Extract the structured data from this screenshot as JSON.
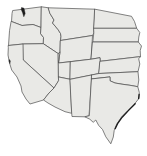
{
  "map": {
    "region": "Western United States",
    "states": [
      "Washington",
      "Oregon",
      "California",
      "Idaho",
      "Nevada",
      "Montana",
      "Wyoming",
      "Utah",
      "Colorado",
      "Arizona",
      "New Mexico",
      "North Dakota",
      "South Dakota",
      "Nebraska",
      "Kansas",
      "Oklahoma",
      "Texas"
    ],
    "features": [
      "puget-sound-inlet",
      "san-francisco-bay-tick",
      "texas-gulf-barrier-islands"
    ],
    "colors": {
      "background": "#ffffff",
      "land_fill": "#e9e9e6",
      "border": "#4d4d4d",
      "water_detail": "#1c1c1c"
    }
  }
}
